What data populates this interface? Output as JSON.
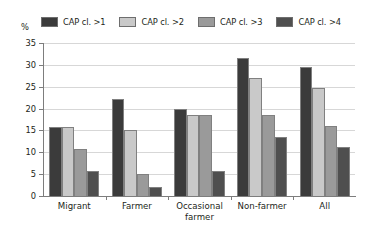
{
  "chart_data": {
    "type": "bar",
    "title": "",
    "subtitle": "",
    "xlabel": "",
    "ylabel": "%",
    "ylim": [
      0,
      35
    ],
    "ytick_step": 5,
    "yticks": [
      0,
      5,
      10,
      15,
      20,
      25,
      30,
      35
    ],
    "grid": true,
    "grid_axis": "y",
    "legend_position": "top",
    "categories": [
      "Migrant",
      "Farmer",
      "Occasional\nfarmer",
      "Non-farmer",
      "All"
    ],
    "series": [
      {
        "name": "CAP cl. >1",
        "color": "#3b3b3b",
        "values": [
          15.8,
          22.3,
          20.0,
          31.5,
          29.5
        ]
      },
      {
        "name": "CAP cl. >2",
        "color": "#c9c9c9",
        "values": [
          15.8,
          15.0,
          18.5,
          27.0,
          24.7
        ]
      },
      {
        "name": "CAP cl. >3",
        "color": "#9a9a9a",
        "values": [
          10.8,
          5.0,
          18.5,
          18.5,
          16.0
        ]
      },
      {
        "name": "CAP cl. >4",
        "color": "#4f4f4f",
        "values": [
          5.8,
          2.0,
          5.8,
          13.5,
          11.3
        ]
      }
    ]
  },
  "axis": {
    "unit_label": "%"
  }
}
